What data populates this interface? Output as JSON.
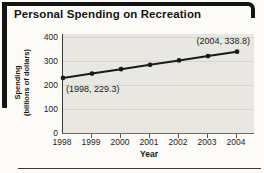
{
  "title": "Personal Spending on Recreation",
  "chart_data": {
    "type": "line",
    "title": "Personal Spending on Recreation",
    "xlabel": "Year",
    "ylabel": "Spending (billions of dollars)",
    "ylabel_line1": "Spending",
    "ylabel_line2": "(billions of dollars)",
    "x": [
      1998,
      1999,
      2000,
      2001,
      2002,
      2003,
      2004
    ],
    "xticks": [
      "1998",
      "1999",
      "2000",
      "2001",
      "2002",
      "2003",
      "2004"
    ],
    "yticks": [
      0,
      100,
      200,
      300,
      400
    ],
    "ylim": [
      0,
      400
    ],
    "grid": true,
    "legend": "none",
    "series": [
      {
        "name": "Personal spending on recreation",
        "values": [
          229.3,
          247.6,
          265.8,
          284.1,
          302.3,
          320.6,
          338.8
        ]
      }
    ],
    "annotations": [
      {
        "text": "(1998, 229.3)",
        "x": 1998,
        "y": 229.3,
        "position": "below-right"
      },
      {
        "text": "(2004, 338.8)",
        "x": 2004,
        "y": 338.8,
        "position": "above-left"
      }
    ],
    "line_color": "#1a1a1a",
    "plot_bg": "#e9e7e2",
    "accent_black": "#141414"
  }
}
